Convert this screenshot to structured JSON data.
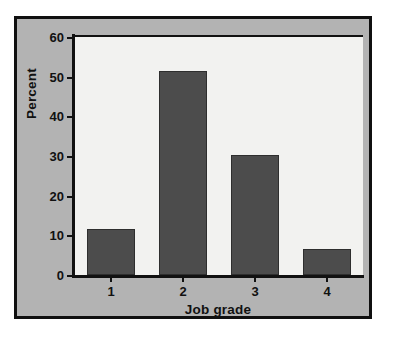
{
  "chart_data": {
    "type": "bar",
    "title": "",
    "categories": [
      "1",
      "2",
      "3",
      "4"
    ],
    "values": [
      11.6,
      51.5,
      30.2,
      6.6
    ],
    "series": [
      {
        "name": "Percent",
        "values": [
          11.6,
          51.5,
          30.2,
          6.6
        ]
      }
    ],
    "xlabel": "Job grade",
    "ylabel": "Percent",
    "ylim": [
      0,
      60
    ],
    "yticks": [
      0,
      10,
      20,
      30,
      40,
      50,
      60
    ],
    "ytick_labels": [
      "0",
      "10",
      "20",
      "30",
      "40",
      "50",
      "60"
    ],
    "xtick_labels": [
      "1",
      "2",
      "3",
      "4"
    ],
    "grid": false,
    "legend": false,
    "legend_position": "none",
    "bar_color": "#4c4c4c",
    "bar_edge_color": "#2e2e2e",
    "plot_background": "#f2f2f0",
    "figure_background": "#b3b3b3",
    "frame_color": "#101010",
    "axis_color": "#111111",
    "outer_background": "#ffffff"
  }
}
